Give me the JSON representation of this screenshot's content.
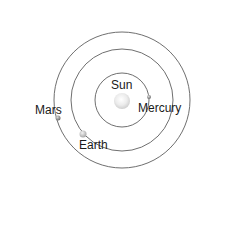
{
  "diagram": {
    "type": "solar-system-orbits",
    "center": {
      "x": 122,
      "y": 100
    },
    "orbits": [
      {
        "name": "mercury-orbit",
        "radius": 27
      },
      {
        "name": "earth-orbit",
        "radius": 51
      },
      {
        "name": "mars-orbit",
        "radius": 68
      }
    ],
    "bodies": [
      {
        "name": "Sun",
        "label": "Sun",
        "x": 122,
        "y": 101,
        "r": 8
      },
      {
        "name": "Mercury",
        "label": "Mercury",
        "x": 149,
        "y": 97,
        "r": 2
      },
      {
        "name": "Earth",
        "label": "Earth",
        "x": 83,
        "y": 134,
        "r": 3.5
      },
      {
        "name": "Mars",
        "label": "Mars",
        "x": 58,
        "y": 118,
        "r": 2.5
      }
    ]
  },
  "labels": {
    "sun": "Sun",
    "mercury": "Mercury",
    "earth": "Earth",
    "mars": "Mars"
  },
  "colors": {
    "orbit": "#6f6f6f",
    "sun": "#e6e6e6",
    "planet": "#9a9a9a",
    "text": "#1a1a1a"
  }
}
